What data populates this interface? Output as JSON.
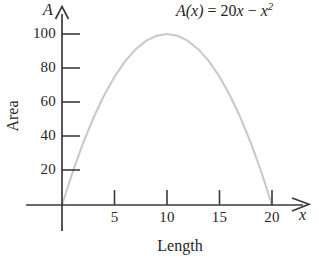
{
  "figure": {
    "equation": "A(x) = 20x − x²",
    "equation_parts": {
      "func_name": "A",
      "open_paren": "(",
      "variable": "x",
      "close_paren": ")",
      "equals": "=",
      "coefficient": "20",
      "linear_var": "x",
      "minus": "−",
      "quad_var": "x",
      "exponent": "2"
    },
    "y_axis_symbol": "A",
    "x_axis_symbol": "x",
    "y_axis_title": "Area",
    "x_axis_title": "Length",
    "curve_color": "#c9c9c9",
    "axis_color": "#3a3a3a",
    "text_color": "#262626"
  },
  "chart_data": {
    "type": "line",
    "title": "",
    "subtitle": "",
    "annotations": [
      "A(x) = 20x − x²"
    ],
    "xlabel": "Length",
    "ylabel": "Area",
    "x_axis_symbol": "x",
    "y_axis_symbol": "A",
    "xlim": [
      0,
      22
    ],
    "ylim": [
      0,
      110
    ],
    "xticks": [
      5,
      10,
      15,
      20
    ],
    "yticks": [
      20,
      40,
      60,
      80,
      100
    ],
    "xtick_labels": [
      "5",
      "10",
      "15",
      "20"
    ],
    "ytick_labels": [
      "20",
      "40",
      "60",
      "80",
      "100"
    ],
    "grid": false,
    "legend": false,
    "legend_position": "none",
    "axis_arrows": true,
    "series": [
      {
        "name": "A(x) = 20x - x^2",
        "formula": "20*x - x^2",
        "color": "#c9c9c9",
        "vertex": [
          10,
          100
        ],
        "roots": [
          0,
          20
        ],
        "x": [
          0,
          1,
          2,
          3,
          4,
          5,
          6,
          7,
          8,
          9,
          10,
          11,
          12,
          13,
          14,
          15,
          16,
          17,
          18,
          19,
          20
        ],
        "values": [
          0,
          19,
          36,
          51,
          64,
          75,
          84,
          91,
          96,
          99,
          100,
          99,
          96,
          91,
          84,
          75,
          64,
          51,
          36,
          19,
          0
        ]
      }
    ]
  }
}
